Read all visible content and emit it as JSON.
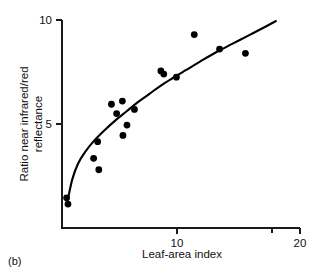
{
  "figure": {
    "panel_label": "(b)",
    "background_color": "#ffffff",
    "ink_color": "#000000"
  },
  "chart_data": {
    "type": "scatter",
    "title": "",
    "subtitle": "",
    "xlabel": "Leaf-area index",
    "ylabel": "Ratio near infrared/red reflectance",
    "ylabel_line1": "Ratio near infrared/red",
    "ylabel_line2": "reflectance",
    "xlim": [
      0,
      20.8
    ],
    "ylim": [
      0,
      11.0
    ],
    "xticks": [
      10,
      20
    ],
    "xtick_labels": [
      "10",
      "20"
    ],
    "yticks": [
      5,
      10
    ],
    "ytick_labels": [
      "5",
      "10"
    ],
    "grid": false,
    "legend": false,
    "legend_position": "none",
    "marker": "filled-circle",
    "marker_color": "#000000",
    "points": [
      {
        "x": 0.4,
        "y": 1.45
      },
      {
        "x": 0.52,
        "y": 1.15
      },
      {
        "x": 2.75,
        "y": 3.35
      },
      {
        "x": 3.1,
        "y": 4.15
      },
      {
        "x": 3.2,
        "y": 2.8
      },
      {
        "x": 4.3,
        "y": 5.95
      },
      {
        "x": 4.75,
        "y": 5.5
      },
      {
        "x": 5.25,
        "y": 6.1
      },
      {
        "x": 5.3,
        "y": 4.45
      },
      {
        "x": 5.65,
        "y": 4.95
      },
      {
        "x": 6.3,
        "y": 5.7
      },
      {
        "x": 8.6,
        "y": 7.55
      },
      {
        "x": 8.85,
        "y": 7.4
      },
      {
        "x": 9.95,
        "y": 7.25
      },
      {
        "x": 11.5,
        "y": 9.3
      },
      {
        "x": 13.7,
        "y": 8.6
      },
      {
        "x": 15.95,
        "y": 8.4
      }
    ],
    "fit_curve": {
      "label": "fitted curve",
      "style": "solid",
      "points": [
        {
          "x": 0.5,
          "y": 1.35
        },
        {
          "x": 0.9,
          "y": 2.35
        },
        {
          "x": 1.4,
          "y": 3.1
        },
        {
          "x": 2.0,
          "y": 3.65
        },
        {
          "x": 2.8,
          "y": 4.2
        },
        {
          "x": 3.7,
          "y": 4.7
        },
        {
          "x": 4.6,
          "y": 5.15
        },
        {
          "x": 5.6,
          "y": 5.6
        },
        {
          "x": 6.6,
          "y": 6.05
        },
        {
          "x": 7.6,
          "y": 6.45
        },
        {
          "x": 8.6,
          "y": 6.85
        },
        {
          "x": 9.6,
          "y": 7.2
        },
        {
          "x": 10.8,
          "y": 7.6
        },
        {
          "x": 12.0,
          "y": 8.0
        },
        {
          "x": 13.4,
          "y": 8.45
        },
        {
          "x": 14.8,
          "y": 8.85
        },
        {
          "x": 16.2,
          "y": 9.25
        },
        {
          "x": 17.6,
          "y": 9.65
        },
        {
          "x": 18.6,
          "y": 9.95
        }
      ]
    }
  }
}
